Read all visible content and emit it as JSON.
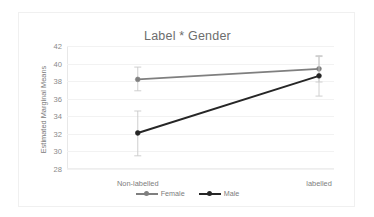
{
  "chart_data": {
    "type": "line",
    "title": "Label * Gender",
    "xlabel": "",
    "ylabel": "Estimated Marginal Means",
    "categories": [
      "Non-labelled",
      "labelled"
    ],
    "ylim": [
      28,
      42
    ],
    "yticks": [
      28,
      30,
      32,
      34,
      36,
      38,
      40,
      42
    ],
    "ytick_labels": [
      "28",
      "30",
      "32",
      "34",
      "36",
      "38",
      "40",
      "42"
    ],
    "grid": true,
    "legend_position": "bottom",
    "error_bars": true,
    "series": [
      {
        "name": "Female",
        "color": "#7f7f7f",
        "values": [
          38.2,
          39.4
        ],
        "error_low": [
          36.9,
          37.9
        ],
        "error_high": [
          39.6,
          40.9
        ]
      },
      {
        "name": "Male",
        "color": "#262626",
        "values": [
          32.1,
          38.6
        ],
        "error_low": [
          29.5,
          36.3
        ],
        "error_high": [
          34.6,
          40.8
        ]
      }
    ]
  },
  "legend": {
    "items": [
      {
        "label": "Female",
        "color": "#7f7f7f"
      },
      {
        "label": "Male",
        "color": "#262626"
      }
    ]
  },
  "colors": {
    "female": "#7f7f7f",
    "male": "#262626",
    "grid": "#f2f2f2",
    "axis": "#e8e8e8",
    "text": "#7d7d7d",
    "title": "#6d6d6d",
    "frame": "#f0f0f0",
    "background": "#ffffff"
  }
}
